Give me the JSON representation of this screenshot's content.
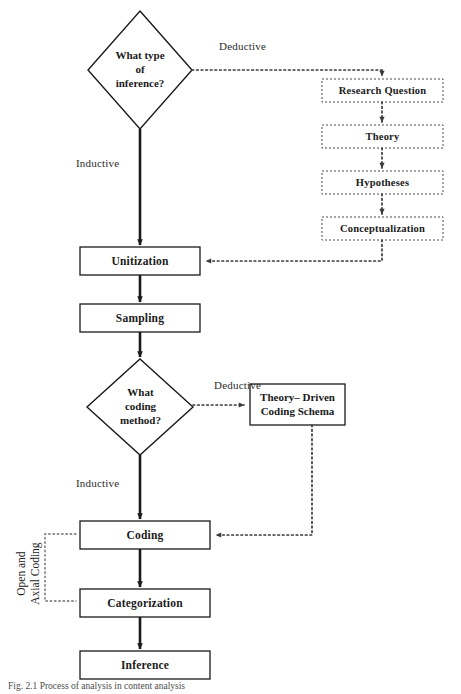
{
  "figure": {
    "caption": "Fig. 2.1  Process of analysis in content analysis",
    "type": "flowchart"
  },
  "nodes": {
    "decision_inference": {
      "label_line1": "What type",
      "label_line2": "of",
      "label_line3": "inference?"
    },
    "decision_coding": {
      "label_line1": "What",
      "label_line2": "coding",
      "label_line3": "method?"
    },
    "research_question": {
      "label": "Research Question"
    },
    "theory": {
      "label": "Theory"
    },
    "hypotheses": {
      "label": "Hypotheses"
    },
    "conceptualization": {
      "label": "Conceptualization"
    },
    "unitization": {
      "label": "Unitization"
    },
    "sampling": {
      "label": "Sampling"
    },
    "theory_driven_schema": {
      "label_line1": "Theory– Driven",
      "label_line2": "Coding Schema"
    },
    "coding": {
      "label": "Coding"
    },
    "categorization": {
      "label": "Categorization"
    },
    "inference": {
      "label": "Inference"
    }
  },
  "edge_labels": {
    "deductive_top": "Deductive",
    "inductive_top": "Inductive",
    "deductive_mid": "Deductive",
    "inductive_mid": "Inductive",
    "open_axial_line1": "Open and",
    "open_axial_line2": "Axial Coding"
  },
  "colors": {
    "stroke": "#1a1a1a",
    "dotted_stroke": "#3a3a3a",
    "box_fill": "#ffffff",
    "background": "#ffffff",
    "text": "#1a1a1a"
  }
}
